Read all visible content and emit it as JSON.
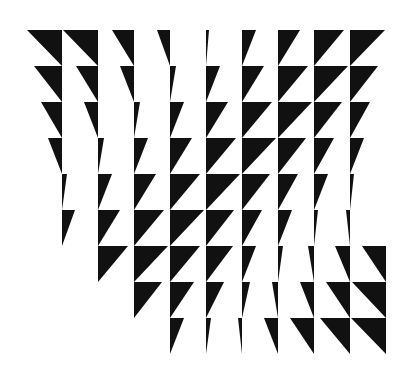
{
  "artwork": {
    "title": "Triangle grid op-art",
    "background": "#ffffff",
    "fill": "#111111",
    "grid": {
      "origin_x": 62,
      "origin_y": 30,
      "cell": 36
    },
    "note": "Each wedge: [line_index, row_index, signed_width]. Vertical edge at x=origin_x+36*line, top at y=origin_y+36*row, height 36. Negative width extends left (\\), positive extends right (/).",
    "wedges": [
      [
        0,
        0,
        -35
      ],
      [
        1,
        0,
        -35
      ],
      [
        2,
        0,
        -22
      ],
      [
        3,
        0,
        -13
      ],
      [
        4,
        0,
        3
      ],
      [
        5,
        0,
        14
      ],
      [
        6,
        0,
        22
      ],
      [
        7,
        0,
        30
      ],
      [
        8,
        0,
        35
      ],
      [
        0,
        1,
        -28
      ],
      [
        1,
        1,
        -22
      ],
      [
        2,
        1,
        -14
      ],
      [
        3,
        1,
        6
      ],
      [
        4,
        1,
        14
      ],
      [
        5,
        1,
        22
      ],
      [
        6,
        1,
        30
      ],
      [
        7,
        1,
        34
      ],
      [
        8,
        1,
        28
      ],
      [
        0,
        2,
        -21
      ],
      [
        1,
        2,
        -14
      ],
      [
        2,
        2,
        6
      ],
      [
        3,
        2,
        14
      ],
      [
        4,
        2,
        22
      ],
      [
        5,
        2,
        30
      ],
      [
        6,
        2,
        34
      ],
      [
        7,
        2,
        28
      ],
      [
        8,
        2,
        20
      ],
      [
        0,
        3,
        -14
      ],
      [
        1,
        3,
        6
      ],
      [
        2,
        3,
        14
      ],
      [
        3,
        3,
        22
      ],
      [
        4,
        3,
        30
      ],
      [
        5,
        3,
        34
      ],
      [
        6,
        3,
        28
      ],
      [
        7,
        3,
        20
      ],
      [
        8,
        3,
        14
      ],
      [
        0,
        4,
        5
      ],
      [
        1,
        4,
        14
      ],
      [
        2,
        4,
        22
      ],
      [
        3,
        4,
        30
      ],
      [
        4,
        4,
        34
      ],
      [
        5,
        4,
        28
      ],
      [
        6,
        4,
        20
      ],
      [
        7,
        4,
        14
      ],
      [
        8,
        4,
        4
      ],
      [
        0,
        5,
        13
      ],
      [
        1,
        5,
        22
      ],
      [
        2,
        5,
        30
      ],
      [
        3,
        5,
        34
      ],
      [
        4,
        5,
        28
      ],
      [
        5,
        5,
        20
      ],
      [
        6,
        5,
        14
      ],
      [
        7,
        5,
        4
      ],
      [
        8,
        5,
        -4
      ],
      [
        1,
        6,
        30
      ],
      [
        2,
        6,
        34
      ],
      [
        3,
        6,
        30
      ],
      [
        4,
        6,
        27
      ],
      [
        5,
        6,
        14
      ],
      [
        6,
        6,
        5
      ],
      [
        7,
        6,
        -6
      ],
      [
        8,
        6,
        -15
      ],
      [
        9,
        6,
        -24
      ],
      [
        2,
        7,
        28
      ],
      [
        3,
        7,
        24
      ],
      [
        4,
        7,
        18
      ],
      [
        5,
        7,
        8
      ],
      [
        6,
        7,
        -6
      ],
      [
        7,
        7,
        -14
      ],
      [
        8,
        7,
        -24
      ],
      [
        9,
        7,
        -34
      ],
      [
        3,
        8,
        14
      ],
      [
        4,
        8,
        5
      ],
      [
        5,
        8,
        -4
      ],
      [
        6,
        8,
        -14
      ],
      [
        7,
        8,
        -24
      ],
      [
        8,
        8,
        -30
      ],
      [
        9,
        8,
        -35
      ]
    ]
  }
}
